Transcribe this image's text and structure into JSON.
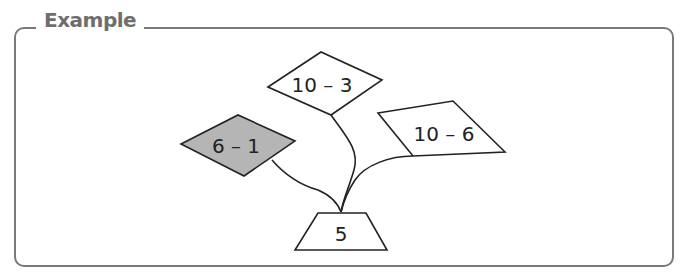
{
  "title": "Example",
  "tree": {
    "root": {
      "label": "5",
      "shape": "trapezoid"
    },
    "branches": [
      {
        "label": "10 – 3",
        "shape": "diamond",
        "highlighted": false
      },
      {
        "label": "6 – 1",
        "shape": "diamond",
        "highlighted": true
      },
      {
        "label": "10 – 6",
        "shape": "parallelogram",
        "highlighted": false
      }
    ]
  },
  "colors": {
    "frame": "#7a7a7a",
    "title": "#6e6e6e",
    "highlight_fill": "#b5b5b5",
    "stroke": "#222222"
  }
}
